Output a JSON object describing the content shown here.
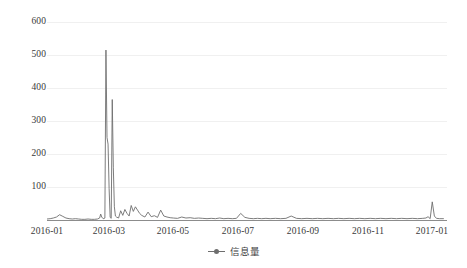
{
  "chart_data": {
    "type": "line",
    "title": "",
    "subtitle": "",
    "xlabel": "",
    "ylabel": "",
    "grid": true,
    "legend_position": "bottom-center",
    "xlim": [
      "2016-01-01",
      "2017-01-15"
    ],
    "ylim": [
      0,
      620
    ],
    "yticks": [
      100,
      200,
      300,
      400,
      500,
      600
    ],
    "ytick_labels": [
      "100",
      "200",
      "300",
      "400",
      "500",
      "600"
    ],
    "xticks": [
      "2016-01",
      "2016-03",
      "2016-05",
      "2016-07",
      "2016-09",
      "2016-11",
      "2017-01"
    ],
    "xtick_labels": [
      "2016-01",
      "2016-03",
      "2016-05",
      "2016-07",
      "2016-09",
      "2016-11",
      "2017-01"
    ],
    "line_color": "#6e6e6e",
    "grid_color": "#f0f0f0",
    "axis_color": "#8c8c8c",
    "series": [
      {
        "name": "信息量",
        "color": "#6e6e6e",
        "x": [
          "2016-01-01",
          "2016-01-04",
          "2016-01-07",
          "2016-01-10",
          "2016-01-13",
          "2016-01-16",
          "2016-01-19",
          "2016-01-22",
          "2016-01-25",
          "2016-01-28",
          "2016-01-31",
          "2016-02-03",
          "2016-02-06",
          "2016-02-09",
          "2016-02-12",
          "2016-02-15",
          "2016-02-18",
          "2016-02-20",
          "2016-02-21",
          "2016-02-22",
          "2016-02-23",
          "2016-02-24",
          "2016-02-25",
          "2016-02-26",
          "2016-02-27",
          "2016-02-28",
          "2016-02-29",
          "2016-03-01",
          "2016-03-02",
          "2016-03-03",
          "2016-03-04",
          "2016-03-05",
          "2016-03-06",
          "2016-03-07",
          "2016-03-09",
          "2016-03-11",
          "2016-03-13",
          "2016-03-15",
          "2016-03-17",
          "2016-03-19",
          "2016-03-21",
          "2016-03-23",
          "2016-03-25",
          "2016-03-27",
          "2016-03-29",
          "2016-03-31",
          "2016-04-03",
          "2016-04-06",
          "2016-04-09",
          "2016-04-12",
          "2016-04-15",
          "2016-04-18",
          "2016-04-21",
          "2016-04-24",
          "2016-04-27",
          "2016-04-30",
          "2016-05-04",
          "2016-05-08",
          "2016-05-12",
          "2016-05-16",
          "2016-05-20",
          "2016-05-24",
          "2016-05-28",
          "2016-06-01",
          "2016-06-05",
          "2016-06-09",
          "2016-06-13",
          "2016-06-17",
          "2016-06-21",
          "2016-06-25",
          "2016-06-29",
          "2016-07-03",
          "2016-07-07",
          "2016-07-11",
          "2016-07-15",
          "2016-07-19",
          "2016-07-23",
          "2016-07-27",
          "2016-07-31",
          "2016-08-05",
          "2016-08-10",
          "2016-08-15",
          "2016-08-20",
          "2016-08-25",
          "2016-08-30",
          "2016-09-04",
          "2016-09-09",
          "2016-09-14",
          "2016-09-19",
          "2016-09-24",
          "2016-09-29",
          "2016-10-04",
          "2016-10-09",
          "2016-10-14",
          "2016-10-19",
          "2016-10-24",
          "2016-10-29",
          "2016-11-03",
          "2016-11-08",
          "2016-11-13",
          "2016-11-18",
          "2016-11-23",
          "2016-11-28",
          "2016-12-03",
          "2016-12-08",
          "2016-12-13",
          "2016-12-18",
          "2016-12-23",
          "2016-12-26",
          "2016-12-28",
          "2016-12-30",
          "2017-01-01",
          "2017-01-03",
          "2017-01-05",
          "2017-01-08",
          "2017-01-12"
        ],
        "values": [
          3,
          4,
          6,
          9,
          16,
          11,
          6,
          4,
          3,
          4,
          3,
          2,
          2,
          3,
          2,
          2,
          3,
          6,
          18,
          9,
          5,
          4,
          6,
          515,
          250,
          230,
          95,
          8,
          5,
          365,
          160,
          40,
          12,
          9,
          6,
          28,
          14,
          32,
          20,
          12,
          44,
          26,
          40,
          30,
          20,
          14,
          9,
          24,
          10,
          13,
          8,
          30,
          12,
          9,
          7,
          6,
          5,
          9,
          6,
          7,
          5,
          6,
          5,
          4,
          5,
          4,
          6,
          4,
          5,
          4,
          5,
          20,
          8,
          5,
          4,
          5,
          4,
          5,
          4,
          5,
          4,
          5,
          12,
          5,
          4,
          5,
          4,
          5,
          4,
          5,
          4,
          5,
          4,
          5,
          4,
          5,
          4,
          5,
          4,
          5,
          4,
          5,
          4,
          5,
          4,
          5,
          4,
          5,
          6,
          10,
          4,
          55,
          12,
          5,
          4,
          4
        ]
      }
    ],
    "notes": {
      "max_peak_value": 515,
      "max_peak_date": "2016-02-24",
      "secondary_peak_value": 365,
      "secondary_peak_date": "2016-03-03",
      "late_peak_value": 55,
      "late_peak_date": "2017-01-01"
    }
  },
  "legend": {
    "items": [
      {
        "label": "信息量",
        "color": "#6e6e6e"
      }
    ]
  }
}
